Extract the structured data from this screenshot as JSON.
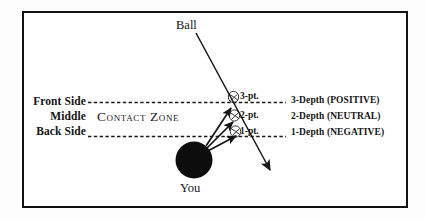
{
  "diagram": {
    "title_text": "Ball",
    "player_text": "You",
    "zone_text": "Contact Zone",
    "side_labels": [
      {
        "id": "front",
        "text": "Front Side"
      },
      {
        "id": "middle",
        "text": "Middle"
      },
      {
        "id": "back",
        "text": "Back Side"
      }
    ],
    "point_markers": [
      {
        "id": "3pt",
        "text": "3-pt."
      },
      {
        "id": "2pt",
        "text": "2-pt."
      },
      {
        "id": "1pt",
        "text": "1-pt."
      }
    ],
    "depth_labels": [
      {
        "id": "depth3",
        "text": "3-Depth (POSITIVE)"
      },
      {
        "id": "depth2",
        "text": "2-Depth (NEUTRAL)"
      },
      {
        "id": "depth1",
        "text": "1-Depth (NEGATIVE)"
      }
    ],
    "colors": {
      "ink": "#151515",
      "border": "#121212",
      "ball": "#0d0d0d",
      "paper": "#ffffff"
    }
  }
}
